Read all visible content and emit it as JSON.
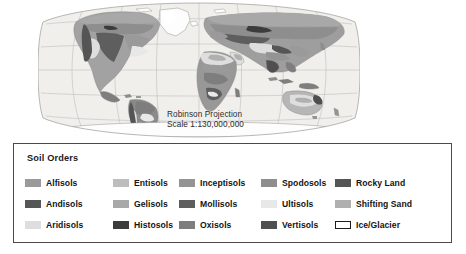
{
  "map": {
    "title": "World Soil Orders Map",
    "projection_label": "Robinson Projection",
    "scale_label": "Scale 1:130,000,000",
    "ocean_color": "#f0efec",
    "graticule_color": "#b2b0ad",
    "outline_color": "#8a8886"
  },
  "legend": {
    "title": "Soil Orders",
    "border_color": "#4a4a4a",
    "columns": [
      {
        "items": [
          {
            "label": "Alfisols",
            "color": "#9a9a9a",
            "outlined": false
          },
          {
            "label": "Andisols",
            "color": "#565656",
            "outlined": false
          },
          {
            "label": "Aridisols",
            "color": "#dedede",
            "outlined": false
          }
        ]
      },
      {
        "items": [
          {
            "label": "Entisols",
            "color": "#bdbdbd",
            "outlined": false
          },
          {
            "label": "Gelisols",
            "color": "#a8a8a8",
            "outlined": false
          },
          {
            "label": "Histosols",
            "color": "#3c3c3c",
            "outlined": false
          }
        ]
      },
      {
        "items": [
          {
            "label": "Inceptisols",
            "color": "#949494",
            "outlined": false
          },
          {
            "label": "Mollisols",
            "color": "#5e5e5e",
            "outlined": false
          },
          {
            "label": "Oxisols",
            "color": "#7e7e7e",
            "outlined": false
          }
        ]
      },
      {
        "items": [
          {
            "label": "Spodosols",
            "color": "#8e8e8e",
            "outlined": false
          },
          {
            "label": "Ultisols",
            "color": "#e8e8e8",
            "outlined": false
          },
          {
            "label": "Vertisols",
            "color": "#4f4f4f",
            "outlined": false
          }
        ]
      },
      {
        "items": [
          {
            "label": "Rocky Land",
            "color": "#555555",
            "outlined": false
          },
          {
            "label": "Shifting Sand",
            "color": "#b0b0b0",
            "outlined": false
          },
          {
            "label": "Ice/Glacier",
            "color": "#ffffff",
            "outlined": true
          }
        ]
      }
    ]
  }
}
